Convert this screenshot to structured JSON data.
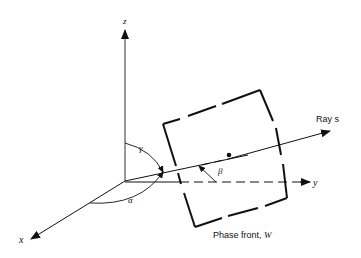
{
  "diagram": {
    "axes": {
      "z_label": "z",
      "x_label": "x",
      "y_label": "y"
    },
    "angles": {
      "alpha": "α",
      "beta": "β",
      "gamma": "γ"
    },
    "ray_label": "Ray s",
    "phase_front_label": "Phase front, ",
    "phase_front_symbol": "W",
    "colors": {
      "line": "#111111",
      "background": "#ffffff"
    }
  }
}
